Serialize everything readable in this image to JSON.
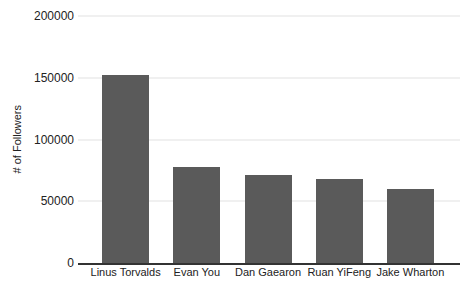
{
  "chart_data": {
    "type": "bar",
    "title": "",
    "categories": [
      "Linus Torvalds",
      "Evan You",
      "Dan Gaearon",
      "Ruan YiFeng",
      "Jake Wharton"
    ],
    "values": [
      152000,
      78000,
      71000,
      68000,
      60000
    ],
    "xlabel": "",
    "ylabel": "# of Followers",
    "ylim": [
      0,
      200000
    ],
    "ytick_values": [
      0,
      50000,
      100000,
      150000,
      200000
    ],
    "ytick_labels": [
      "0",
      "50000",
      "100000",
      "150000",
      "200000"
    ],
    "grid": true,
    "legend": false,
    "colors": {
      "bar": "#5a5a5a",
      "gridline": "#e2e2e2",
      "axis_line": "#333333",
      "text": "#222222",
      "background": "#ffffff"
    }
  }
}
